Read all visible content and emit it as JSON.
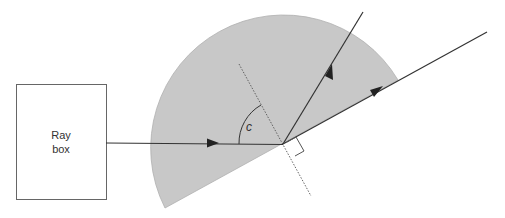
{
  "diagram": {
    "title": "",
    "ray_box": {
      "label_line1": "Ray",
      "label_line2": "box"
    },
    "angle_label": "c",
    "colors": {
      "block_fill": "#c8c8c8",
      "line": "#333333",
      "normal_line": "#555555",
      "box_stroke": "#666666"
    },
    "elements": [
      "ray box",
      "semicircular glass block",
      "incident ray",
      "normal (dotted)",
      "critical angle c",
      "right-angle marker",
      "internally reflected ray",
      "emergent ray along flat surface"
    ]
  }
}
